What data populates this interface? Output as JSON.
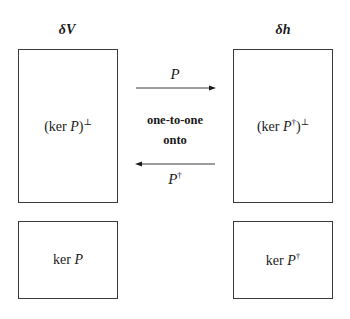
{
  "diagram": {
    "left_column": {
      "header": "δV",
      "top_box": {
        "prefix": "(ker ",
        "var": "P",
        "suffix": ")",
        "sup": "⊥"
      },
      "bottom_box": {
        "prefix": "ker ",
        "var": "P",
        "sup": ""
      }
    },
    "right_column": {
      "header": "δh",
      "top_box": {
        "prefix": "(ker ",
        "var": "P",
        "dagger": "†",
        "suffix": ")",
        "sup": "⊥"
      },
      "bottom_box": {
        "prefix": "ker ",
        "var": "P",
        "dagger": "†"
      }
    },
    "center": {
      "line1": "one-to-one",
      "line2": "onto"
    },
    "arrows": {
      "forward": {
        "label": "P",
        "direction": "right"
      },
      "backward": {
        "label": "P",
        "label_sup": "†",
        "direction": "left"
      }
    },
    "colors": {
      "stroke": "#3a3a3a",
      "text": "#1a1a1a",
      "background": "#ffffff"
    }
  }
}
